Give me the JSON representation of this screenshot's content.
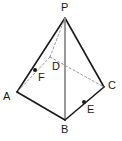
{
  "figure": {
    "kind": "geometry-diagram",
    "background_color": "#ffffff",
    "stroke_color": "#1a1a1a",
    "hidden_stroke_color": "#9a9a9a",
    "axis_stroke_color": "#808080",
    "point_fill_color": "#1a1a1a",
    "label_color": "#1a1a1a"
  },
  "vertices": [
    {
      "id": "P",
      "label": "P",
      "x": 65,
      "y": 18,
      "label_x": 61,
      "label_y": 2,
      "hidden": false
    },
    {
      "id": "A",
      "label": "A",
      "x": 17,
      "y": 92,
      "label_x": 3,
      "label_y": 91,
      "hidden": false
    },
    {
      "id": "B",
      "label": "B",
      "x": 65,
      "y": 120,
      "label_x": 61,
      "label_y": 124,
      "hidden": false
    },
    {
      "id": "C",
      "label": "C",
      "x": 104,
      "y": 87,
      "label_x": 108,
      "label_y": 80,
      "hidden": false
    },
    {
      "id": "D",
      "label": "D",
      "x": 50,
      "y": 57,
      "label_x": 52,
      "label_y": 61,
      "hidden": true
    }
  ],
  "marked_points": [
    {
      "id": "F",
      "label": "F",
      "x": 35,
      "y": 70,
      "label_x": 38,
      "label_y": 72,
      "radius": 2
    },
    {
      "id": "E",
      "label": "E",
      "x": 84,
      "y": 102,
      "label_x": 87,
      "label_y": 104,
      "radius": 2
    }
  ],
  "edges": [
    {
      "id": "PA",
      "from": "P",
      "to": "A",
      "style": "solid",
      "color": "#1a1a1a",
      "width": 1.6
    },
    {
      "id": "PC",
      "from": "P",
      "to": "C",
      "style": "solid",
      "color": "#1a1a1a",
      "width": 1.6
    },
    {
      "id": "PB",
      "from": "P",
      "to": "B",
      "style": "solid",
      "color": "#808080",
      "width": 1.6
    },
    {
      "id": "AB",
      "from": "A",
      "to": "B",
      "style": "solid",
      "color": "#1a1a1a",
      "width": 1.6
    },
    {
      "id": "BC",
      "from": "B",
      "to": "C",
      "style": "solid",
      "color": "#1a1a1a",
      "width": 1.6
    },
    {
      "id": "PD",
      "from": "P",
      "to": "D",
      "style": "dashed",
      "color": "#9a9a9a",
      "width": 1.0
    },
    {
      "id": "DA",
      "from": "D",
      "to": "A",
      "style": "dashed",
      "color": "#9a9a9a",
      "width": 1.0
    },
    {
      "id": "DC",
      "from": "D",
      "to": "C",
      "style": "dashed",
      "color": "#9a9a9a",
      "width": 1.0
    }
  ]
}
